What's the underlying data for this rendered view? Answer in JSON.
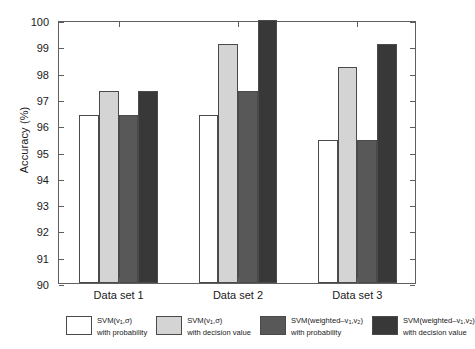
{
  "chart_data": {
    "type": "bar",
    "title": "",
    "xlabel": "",
    "ylabel": "Accuracy (%)",
    "ylim": [
      90,
      100
    ],
    "ytick_values": [
      90,
      91,
      92,
      93,
      94,
      95,
      96,
      97,
      98,
      99,
      100
    ],
    "ytick_labels": [
      "90",
      "91",
      "92",
      "93",
      "94",
      "95",
      "96",
      "97",
      "98",
      "99",
      "100"
    ],
    "grid": false,
    "legend_position": "below-axes",
    "categories": [
      "Data set 1",
      "Data set 2",
      "Data set 3"
    ],
    "series": [
      {
        "name": "SVM(v1,σ) with probability",
        "color": "#ffffff",
        "values": [
          96.4,
          96.4,
          95.45
        ]
      },
      {
        "name": "SVM(v1,σ) with decision value",
        "color": "#d4d4d4",
        "values": [
          97.3,
          99.1,
          98.2
        ]
      },
      {
        "name": "SVM(weighted–v1,v2) with probability",
        "color": "#585858",
        "values": [
          96.4,
          97.3,
          95.45
        ]
      },
      {
        "name": "SVM(weighted–v1,v2) with decision value",
        "color": "#383838",
        "values": [
          97.3,
          100.0,
          99.1
        ]
      }
    ]
  },
  "axes": {
    "y_title": "Accuracy (%)",
    "y_ticks": [
      "100",
      "99",
      "98",
      "97",
      "96",
      "95",
      "94",
      "93",
      "92",
      "91",
      "90"
    ],
    "x_ticks": [
      "Data set 1",
      "Data set 2",
      "Data set 3"
    ]
  },
  "legend": {
    "items": [
      {
        "swatch_color": "#ffffff",
        "line1_pre": "SVM(v",
        "line1_sub": "1",
        "line1_post": ",σ)",
        "line2": "with probability"
      },
      {
        "swatch_color": "#d4d4d4",
        "line1_pre": "SVM(v",
        "line1_sub": "1",
        "line1_post": ",σ)",
        "line2": "with decision value"
      },
      {
        "swatch_color": "#585858",
        "line1_pre": "SVM(weighted–v",
        "line1_sub": "1",
        "line1_mid": ",v",
        "line1_sub2": "2",
        "line1_post": ")",
        "line2": "with probability"
      },
      {
        "swatch_color": "#383838",
        "line1_pre": "SVM(weighted–v",
        "line1_sub": "1",
        "line1_mid": ",v",
        "line1_sub2": "2",
        "line1_post": ")",
        "line2": "with decision value"
      }
    ]
  }
}
